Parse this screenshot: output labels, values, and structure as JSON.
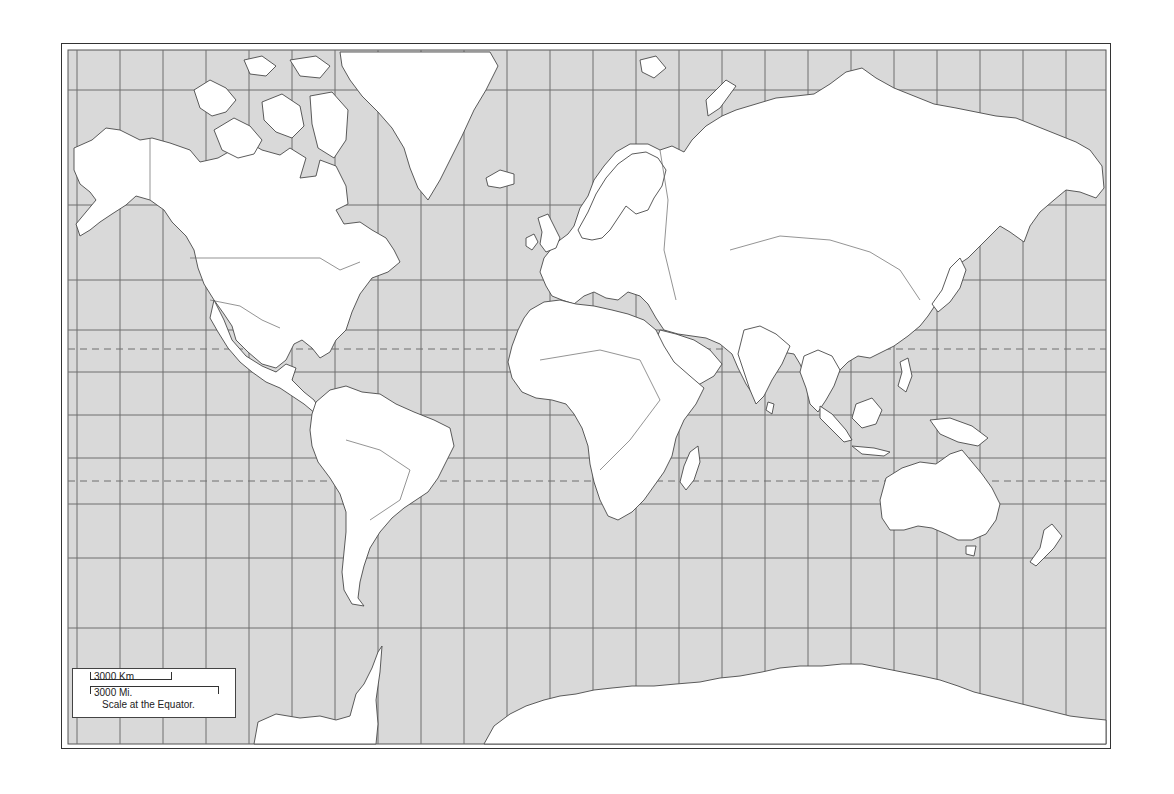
{
  "map": {
    "type": "World outline map",
    "projection": "Mercator",
    "ocean_color": "#d9d9d9",
    "land_color": "#ffffff",
    "border_color": "#555555",
    "grid_color": "#777777",
    "frame": {
      "outer": [
        61,
        43,
        1113,
        751
      ],
      "inner": [
        68,
        50,
        1106,
        744
      ]
    },
    "grid": {
      "meridians_x": [
        77,
        120,
        163,
        206,
        249,
        292,
        335,
        378,
        421,
        464,
        507,
        550,
        593,
        636,
        679,
        722,
        765,
        808,
        851,
        894,
        937,
        980,
        1023,
        1066
      ],
      "parallels_y": [
        90,
        205,
        280,
        330,
        372,
        415,
        458,
        504,
        558,
        628
      ],
      "dashed_lines": [
        {
          "name": "Tropic of Cancer",
          "y": 349
        },
        {
          "name": "Tropic of Capricorn",
          "y": 481
        }
      ]
    }
  },
  "scale": {
    "km_label": "3000 Km",
    "mi_label": "3000 Mi.",
    "caption": "Scale at the Equator."
  }
}
